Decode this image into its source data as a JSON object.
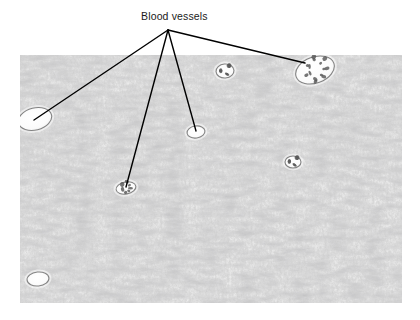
{
  "figure": {
    "kind": "histology-micrograph",
    "background_color": "#ffffff",
    "annotation_color": "#000000",
    "label": {
      "text": "Blood vessels",
      "color": "#1a1a1a",
      "x": 141,
      "y": 10
    },
    "leader_lines": {
      "origin": {
        "x": 168,
        "y": 30
      },
      "stroke_color": "#000000",
      "stroke_width": 1.4,
      "endpoints": [
        {
          "name": "vessel-left",
          "x": 34,
          "y": 120
        },
        {
          "name": "vessel-lower-mid",
          "x": 126,
          "y": 187
        },
        {
          "name": "vessel-center",
          "x": 196,
          "y": 131
        },
        {
          "name": "vessel-upper-right",
          "x": 305,
          "y": 63
        }
      ]
    },
    "micrograph": {
      "x": 20,
      "y": 55,
      "width": 382,
      "height": 248,
      "stain": "H&E",
      "tissue_description": "dense spindle-cell connective tissue",
      "tone_light": "#f0f0f0",
      "tone_mid": "#b4b4b4",
      "tone_dark": "#555555",
      "vessels": [
        {
          "name": "vessel-upper-right",
          "cx": 295,
          "cy": 15,
          "rx": 20,
          "ry": 13,
          "rot": -20,
          "labeled": true,
          "has_cells": true
        },
        {
          "name": "vessel-left",
          "cx": 15,
          "cy": 64,
          "rx": 17,
          "ry": 11,
          "rot": -14,
          "labeled": true,
          "has_cells": false
        },
        {
          "name": "vessel-center",
          "cx": 176,
          "cy": 77,
          "rx": 9,
          "ry": 6,
          "rot": -8,
          "labeled": true,
          "has_cells": false
        },
        {
          "name": "vessel-lower-mid",
          "cx": 106,
          "cy": 133,
          "rx": 10,
          "ry": 6,
          "rot": -10,
          "labeled": true,
          "has_cells": true
        },
        {
          "name": "vessel-unlabeled-top",
          "cx": 205,
          "cy": 16,
          "rx": 9,
          "ry": 7,
          "rot": -5,
          "labeled": false,
          "has_cells": true
        },
        {
          "name": "vessel-unlabeled-mid-right",
          "cx": 273,
          "cy": 107,
          "rx": 8,
          "ry": 6,
          "rot": 0,
          "labeled": false,
          "has_cells": true
        },
        {
          "name": "vessel-unlabeled-bottom-left",
          "cx": 18,
          "cy": 224,
          "rx": 11,
          "ry": 7,
          "rot": -6,
          "labeled": false,
          "has_cells": false
        }
      ]
    }
  }
}
